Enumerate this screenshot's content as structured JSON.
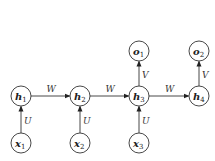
{
  "diagram": {
    "title": "",
    "nodes": [
      {
        "id": "h1",
        "base": "h",
        "sub": "1",
        "x": 21,
        "y": 96
      },
      {
        "id": "h2",
        "base": "h",
        "sub": "2",
        "x": 80,
        "y": 96
      },
      {
        "id": "h3",
        "base": "h",
        "sub": "3",
        "x": 139,
        "y": 96
      },
      {
        "id": "h4",
        "base": "h",
        "sub": "4",
        "x": 199,
        "y": 96
      },
      {
        "id": "x1",
        "base": "x",
        "sub": "1",
        "x": 21,
        "y": 143
      },
      {
        "id": "x2",
        "base": "x",
        "sub": "2",
        "x": 80,
        "y": 143
      },
      {
        "id": "x3",
        "base": "x",
        "sub": "3",
        "x": 139,
        "y": 143
      },
      {
        "id": "o1",
        "base": "o",
        "sub": "1",
        "x": 139,
        "y": 51
      },
      {
        "id": "o2",
        "base": "o",
        "sub": "2",
        "x": 199,
        "y": 51
      }
    ],
    "edges": [
      {
        "from": "h1",
        "to": "h2",
        "label": "W"
      },
      {
        "from": "h2",
        "to": "h3",
        "label": "W"
      },
      {
        "from": "h3",
        "to": "h4",
        "label": "W"
      },
      {
        "from": "x1",
        "to": "h1",
        "label": "U"
      },
      {
        "from": "x2",
        "to": "h2",
        "label": "U"
      },
      {
        "from": "x3",
        "to": "h3",
        "label": "U"
      },
      {
        "from": "h3",
        "to": "o1",
        "label": "V"
      },
      {
        "from": "h4",
        "to": "o2",
        "label": "V"
      }
    ]
  }
}
